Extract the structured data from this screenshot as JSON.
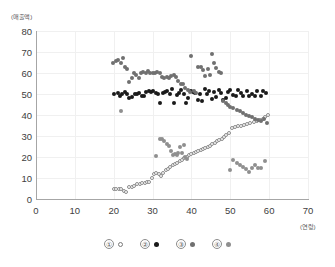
{
  "chart_data": {
    "type": "scatter",
    "title": "",
    "xlabel": "(연령)",
    "ylabel": "(매출액)",
    "xlim": [
      0,
      70
    ],
    "ylim": [
      0,
      80
    ],
    "xticks": [
      0,
      10,
      20,
      30,
      40,
      50,
      60,
      70
    ],
    "yticks": [
      0,
      10,
      20,
      30,
      40,
      50,
      60,
      70,
      80
    ],
    "grid": true,
    "legend_position": "bottom",
    "series": [
      {
        "name": "①",
        "marker": "open-circle",
        "color": "#ffffff",
        "edge_color": "#8c8c8c",
        "points": [
          [
            20.0,
            5.0
          ],
          [
            20.7,
            5.0
          ],
          [
            21.4,
            5.0
          ],
          [
            22.0,
            5.0
          ],
          [
            22.6,
            4.0
          ],
          [
            23.2,
            3.5
          ],
          [
            24.0,
            5.6
          ],
          [
            24.6,
            5.8
          ],
          [
            25.3,
            6.4
          ],
          [
            26.0,
            7.0
          ],
          [
            26.7,
            7.1
          ],
          [
            27.4,
            7.4
          ],
          [
            28.0,
            7.6
          ],
          [
            28.6,
            8.0
          ],
          [
            29.2,
            8.1
          ],
          [
            29.8,
            10.0
          ],
          [
            30.4,
            11.8
          ],
          [
            31.0,
            12.2
          ],
          [
            31.6,
            12.0
          ],
          [
            32.2,
            11.0
          ],
          [
            32.8,
            12.6
          ],
          [
            33.4,
            13.6
          ],
          [
            34.0,
            14.4
          ],
          [
            34.6,
            15.2
          ],
          [
            35.2,
            16.0
          ],
          [
            35.8,
            16.6
          ],
          [
            36.4,
            17.2
          ],
          [
            37.0,
            18.0
          ],
          [
            37.6,
            18.8
          ],
          [
            38.2,
            19.4
          ],
          [
            38.8,
            20.1
          ],
          [
            39.4,
            20.8
          ],
          [
            40.0,
            21.2
          ],
          [
            40.6,
            21.8
          ],
          [
            41.2,
            22.2
          ],
          [
            41.8,
            22.8
          ],
          [
            42.4,
            23.2
          ],
          [
            43.0,
            23.8
          ],
          [
            43.6,
            24.4
          ],
          [
            44.2,
            25.0
          ],
          [
            44.8,
            25.4
          ],
          [
            45.4,
            26.0
          ],
          [
            46.0,
            26.8
          ],
          [
            46.6,
            27.4
          ],
          [
            47.2,
            28.2
          ],
          [
            47.8,
            28.8
          ],
          [
            48.4,
            29.6
          ],
          [
            49.0,
            30.4
          ],
          [
            49.6,
            31.2
          ],
          [
            50.4,
            34.0
          ],
          [
            51.2,
            34.4
          ],
          [
            52.0,
            34.6
          ],
          [
            52.8,
            35.0
          ],
          [
            53.6,
            35.4
          ],
          [
            54.4,
            35.8
          ],
          [
            55.2,
            36.2
          ],
          [
            56.0,
            36.6
          ],
          [
            56.8,
            37.0
          ],
          [
            57.6,
            37.4
          ],
          [
            58.4,
            38.0
          ],
          [
            59.0,
            39.0
          ],
          [
            59.6,
            40.0
          ]
        ]
      },
      {
        "name": "②",
        "marker": "filled-circle",
        "color": "#1a1a1a",
        "points": [
          [
            20.2,
            50.0
          ],
          [
            21.0,
            50.6
          ],
          [
            21.6,
            49.2
          ],
          [
            22.2,
            50.0
          ],
          [
            22.8,
            51.0
          ],
          [
            23.4,
            50.2
          ],
          [
            24.0,
            48.0
          ],
          [
            24.8,
            48.4
          ],
          [
            25.4,
            50.0
          ],
          [
            26.0,
            50.2
          ],
          [
            26.6,
            50.4
          ],
          [
            27.2,
            49.0
          ],
          [
            27.8,
            49.0
          ],
          [
            28.4,
            51.0
          ],
          [
            29.0,
            51.4
          ],
          [
            29.6,
            50.8
          ],
          [
            30.2,
            51.6
          ],
          [
            30.8,
            50.6
          ],
          [
            31.4,
            49.8
          ],
          [
            32.0,
            45.6
          ],
          [
            32.6,
            50.4
          ],
          [
            33.2,
            51.0
          ],
          [
            33.8,
            51.4
          ],
          [
            34.4,
            50.2
          ],
          [
            35.0,
            52.2
          ],
          [
            35.6,
            45.8
          ],
          [
            36.2,
            49.4
          ],
          [
            36.8,
            50.6
          ],
          [
            37.4,
            52.0
          ],
          [
            38.0,
            49.8
          ],
          [
            38.6,
            45.6
          ],
          [
            39.2,
            48.0
          ],
          [
            39.8,
            51.2
          ],
          [
            40.4,
            51.0
          ],
          [
            41.0,
            50.6
          ],
          [
            41.6,
            47.0
          ],
          [
            42.2,
            50.0
          ],
          [
            42.8,
            46.8
          ],
          [
            43.4,
            52.6
          ],
          [
            44.0,
            50.0
          ],
          [
            44.6,
            51.4
          ],
          [
            45.2,
            47.6
          ],
          [
            45.8,
            51.0
          ],
          [
            46.4,
            48.4
          ],
          [
            47.0,
            52.0
          ],
          [
            47.6,
            50.4
          ],
          [
            48.2,
            47.2
          ],
          [
            48.8,
            48.0
          ],
          [
            49.4,
            50.8
          ],
          [
            50.0,
            51.8
          ],
          [
            50.8,
            49.6
          ],
          [
            51.4,
            49.2
          ],
          [
            52.0,
            52.0
          ],
          [
            52.8,
            50.4
          ],
          [
            53.4,
            49.0
          ],
          [
            54.2,
            51.2
          ],
          [
            54.8,
            49.0
          ],
          [
            55.6,
            49.8
          ],
          [
            56.4,
            49.0
          ],
          [
            57.0,
            51.4
          ],
          [
            57.8,
            49.0
          ],
          [
            58.4,
            51.4
          ],
          [
            59.2,
            50.4
          ]
        ]
      },
      {
        "name": "③",
        "marker": "filled-circle",
        "color": "#707070",
        "points": [
          [
            19.8,
            64.8
          ],
          [
            20.6,
            65.6
          ],
          [
            21.2,
            66.0
          ],
          [
            21.8,
            65.0
          ],
          [
            22.4,
            67.0
          ],
          [
            23.0,
            62.8
          ],
          [
            23.4,
            62.0
          ],
          [
            24.0,
            55.8
          ],
          [
            24.6,
            57.6
          ],
          [
            25.2,
            60.0
          ],
          [
            25.8,
            59.0
          ],
          [
            26.4,
            57.4
          ],
          [
            27.0,
            59.8
          ],
          [
            27.6,
            60.4
          ],
          [
            28.2,
            60.0
          ],
          [
            28.8,
            61.0
          ],
          [
            29.4,
            59.8
          ],
          [
            30.0,
            60.0
          ],
          [
            30.6,
            60.2
          ],
          [
            31.2,
            60.6
          ],
          [
            31.8,
            60.0
          ],
          [
            32.4,
            58.0
          ],
          [
            33.0,
            57.8
          ],
          [
            33.6,
            58.0
          ],
          [
            34.2,
            57.8
          ],
          [
            34.8,
            58.8
          ],
          [
            35.4,
            59.0
          ],
          [
            36.0,
            58.2
          ],
          [
            36.6,
            56.0
          ],
          [
            37.2,
            54.6
          ],
          [
            37.8,
            55.0
          ],
          [
            38.4,
            53.0
          ],
          [
            39.0,
            52.0
          ],
          [
            39.6,
            51.0
          ],
          [
            40.0,
            68.0
          ],
          [
            40.6,
            51.6
          ],
          [
            41.2,
            50.6
          ],
          [
            41.8,
            63.0
          ],
          [
            42.4,
            63.0
          ],
          [
            43.0,
            61.2
          ],
          [
            43.6,
            58.8
          ],
          [
            44.2,
            62.0
          ],
          [
            44.8,
            59.0
          ],
          [
            45.2,
            69.0
          ],
          [
            45.8,
            64.8
          ],
          [
            46.4,
            62.4
          ],
          [
            47.0,
            60.6
          ],
          [
            47.6,
            59.8
          ],
          [
            48.2,
            46.8
          ],
          [
            48.8,
            45.6
          ],
          [
            49.4,
            44.8
          ],
          [
            50.0,
            44.0
          ],
          [
            50.8,
            43.4
          ],
          [
            51.6,
            42.4
          ],
          [
            52.4,
            41.8
          ],
          [
            53.2,
            41.0
          ],
          [
            54.0,
            40.0
          ],
          [
            54.8,
            39.6
          ],
          [
            55.6,
            39.0
          ],
          [
            56.4,
            38.2
          ],
          [
            57.2,
            37.8
          ],
          [
            58.0,
            37.2
          ],
          [
            58.8,
            38.2
          ],
          [
            59.4,
            36.4
          ]
        ]
      },
      {
        "name": "④",
        "marker": "filled-circle",
        "color": "#8f8f8f",
        "points": [
          [
            22.0,
            41.8
          ],
          [
            31.0,
            20.4
          ],
          [
            31.8,
            28.8
          ],
          [
            32.4,
            28.4
          ],
          [
            33.0,
            27.4
          ],
          [
            33.6,
            26.4
          ],
          [
            34.2,
            25.4
          ],
          [
            34.8,
            23.0
          ],
          [
            35.2,
            20.8
          ],
          [
            35.8,
            21.6
          ],
          [
            36.2,
            21.0
          ],
          [
            36.6,
            22.0
          ],
          [
            37.0,
            24.6
          ],
          [
            37.6,
            22.0
          ],
          [
            38.0,
            25.8
          ],
          [
            38.4,
            20.0
          ],
          [
            38.8,
            19.2
          ],
          [
            50.0,
            14.0
          ],
          [
            50.8,
            18.4
          ],
          [
            51.6,
            17.0
          ],
          [
            52.4,
            16.4
          ],
          [
            53.2,
            15.2
          ],
          [
            54.0,
            14.2
          ],
          [
            54.8,
            13.0
          ],
          [
            55.6,
            14.8
          ],
          [
            56.4,
            16.0
          ],
          [
            57.2,
            15.0
          ],
          [
            58.0,
            14.8
          ],
          [
            59.0,
            18.0
          ]
        ]
      }
    ]
  },
  "legend": {
    "items": [
      {
        "num": "①",
        "swatch_class": "lg1"
      },
      {
        "num": "②",
        "swatch_class": "lg2"
      },
      {
        "num": "③",
        "swatch_class": "lg3"
      },
      {
        "num": "④",
        "swatch_class": "lg4"
      }
    ]
  }
}
